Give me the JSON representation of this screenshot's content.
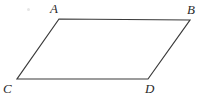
{
  "figure": {
    "type": "parallelogram",
    "title": "",
    "background_color": "#ffffff",
    "stroke_color": "#3a3a3a",
    "stroke_width": 1.2,
    "label_color": "#2b2b2b",
    "vertices": [
      {
        "id": "A",
        "label": "A",
        "x": 59,
        "y": 19,
        "label_x": 50,
        "label_y": 2
      },
      {
        "id": "B",
        "label": "B",
        "x": 190,
        "y": 20,
        "label_x": 187,
        "label_y": 3
      },
      {
        "id": "D",
        "label": "D",
        "x": 148,
        "y": 79,
        "label_x": 145,
        "label_y": 82
      },
      {
        "id": "C",
        "label": "C",
        "x": 17,
        "y": 79,
        "label_x": 3,
        "label_y": 82
      }
    ],
    "edges": [
      {
        "id": "AB",
        "from": "A",
        "to": "B",
        "name": "top-edge"
      },
      {
        "id": "BD",
        "from": "B",
        "to": "D",
        "name": "right-edge"
      },
      {
        "id": "DC",
        "from": "D",
        "to": "C",
        "name": "bottom-edge"
      },
      {
        "id": "CA",
        "from": "C",
        "to": "A",
        "name": "left-edge"
      }
    ],
    "path": "M 59 19 L 190 20 L 148 79 L 17 79 Z"
  }
}
